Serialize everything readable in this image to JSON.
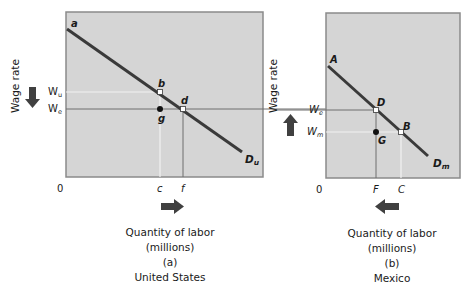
{
  "colors": {
    "panel_fill": "#d5d5d5",
    "panel_border": "#8a8a8a",
    "demand_line": "#3a3a3a",
    "guide_dark": "#6e6e6e",
    "guide_light": "#f2f2f2",
    "arrow": "#404040"
  },
  "panels": [
    {
      "id": "a",
      "y_axis_label": "Wage rate",
      "origin_label": "0",
      "wage_labels": {
        "upper": "W",
        "upper_sub": "u",
        "lower": "W",
        "lower_sub": "e"
      },
      "points": {
        "top": "a",
        "upper": "b",
        "equilibrium": "d",
        "below": "g"
      },
      "x_ticks": [
        "c",
        "f"
      ],
      "demand_label": "D",
      "demand_sub": "u",
      "wage_arrow": "down",
      "labor_arrow": "right",
      "x_axis_label": "Quantity of labor",
      "x_axis_unit": "(millions)",
      "panel_tag": "(a)",
      "country": "United States"
    },
    {
      "id": "b",
      "y_axis_label": "Wage rate",
      "origin_label": "0",
      "wage_labels": {
        "upper": "W",
        "upper_sub": "e",
        "lower": "W",
        "lower_sub": "m"
      },
      "points": {
        "top": "A",
        "equilibrium": "D",
        "lower": "B",
        "below": "G"
      },
      "x_ticks": [
        "F",
        "C"
      ],
      "demand_label": "D",
      "demand_sub": "m",
      "wage_arrow": "up",
      "labor_arrow": "left",
      "x_axis_label": "Quantity of labor",
      "x_axis_unit": "(millions)",
      "panel_tag": "(b)",
      "country": "Mexico"
    }
  ]
}
